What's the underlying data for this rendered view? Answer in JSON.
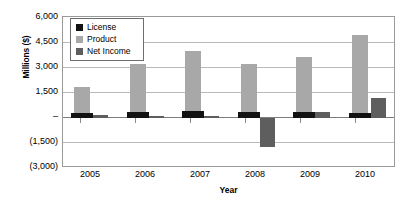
{
  "chart_data": {
    "type": "bar",
    "title": "",
    "xlabel": "Year",
    "ylabel": "Millions ($)",
    "categories": [
      "2005",
      "2006",
      "2007",
      "2008",
      "2009",
      "2010"
    ],
    "series": [
      {
        "name": "License",
        "color": "#121212",
        "values": [
          300,
          330,
          380,
          360,
          330,
          300
        ]
      },
      {
        "name": "Product",
        "color": "#a8a8a8",
        "values": [
          1800,
          3200,
          3950,
          3200,
          3600,
          4900
        ]
      },
      {
        "name": "Net Income",
        "color": "#5e5e5e",
        "values": [
          150,
          100,
          100,
          -1750,
          350,
          1150
        ]
      }
    ],
    "ylim": [
      -3000,
      6000
    ],
    "ytick_values": [
      6000,
      4500,
      3000,
      1500,
      0,
      -1500,
      -3000
    ],
    "ytick_labels": [
      "6,000",
      "4,500",
      "3,000",
      "1,500",
      "–",
      "(1,500)",
      "(3,000)"
    ],
    "grid": true,
    "legend_position": "upper-left-inside",
    "legend_entries": [
      "License",
      "Product",
      "Net Income"
    ]
  },
  "axes": {
    "y_title": "Millions ($)",
    "x_title": "Year"
  }
}
